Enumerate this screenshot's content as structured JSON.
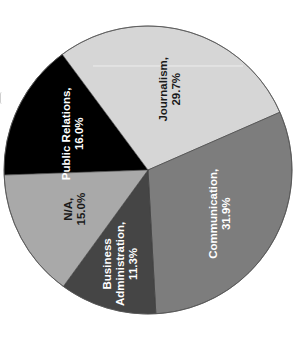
{
  "chart_data": {
    "type": "pie",
    "title": "",
    "orientation": "rotated 90° counter-clockwise (labels read bottom-to-top)",
    "categories": [
      "Public Relations",
      "Journalism",
      "Communication",
      "Business Administration",
      "N/A"
    ],
    "values": [
      16.0,
      29.7,
      31.9,
      11.3,
      15.0
    ],
    "unit": "%",
    "labels": [
      {
        "name": "Public Relations,",
        "value": "16.0%"
      },
      {
        "name": "Journalism,",
        "value": "29.7%"
      },
      {
        "name": "Communication,",
        "value": "31.9%"
      },
      {
        "name": "Business Administration,",
        "value": "11.3%"
      },
      {
        "name": "N/A,",
        "value": "15.0%"
      }
    ],
    "colors": [
      "#000000",
      "#d6d6d6",
      "#7d7d7d",
      "#454545",
      "#a9a9a9"
    ],
    "label_colors": [
      "#ffffff",
      "#1a1a1a",
      "#ffffff",
      "#ffffff",
      "#1a1a1a"
    ],
    "legend": false
  },
  "layout": {
    "center": [
      148,
      170
    ],
    "radius": 144,
    "start_angle_deg": 178
  }
}
